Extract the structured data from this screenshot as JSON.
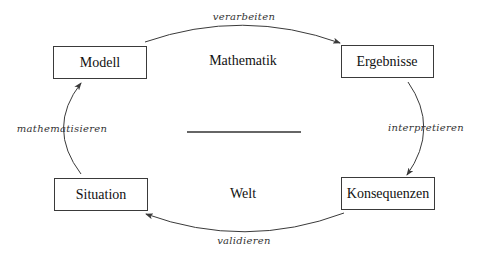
{
  "diagram": {
    "regions": {
      "top": "Mathematik",
      "bottom": "Welt"
    },
    "nodes": {
      "modell": "Modell",
      "ergebnisse": "Ergebnisse",
      "situation": "Situation",
      "konsequenzen": "Konsequenzen"
    },
    "edges": {
      "verarbeiten": {
        "label": "verarbeiten",
        "from": "Modell",
        "to": "Ergebnisse"
      },
      "interpretieren": {
        "label": "interpretieren",
        "from": "Ergebnisse",
        "to": "Konsequenzen"
      },
      "validieren": {
        "label": "validieren",
        "from": "Konsequenzen",
        "to": "Situation"
      },
      "mathematisieren": {
        "label": "mathematisieren",
        "from": "Situation",
        "to": "Modell"
      }
    },
    "colors": {
      "stroke": "#3a3a3a",
      "text": "#111111",
      "background": "#ffffff"
    }
  }
}
